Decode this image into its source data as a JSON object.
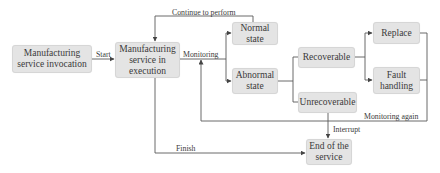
{
  "diagram": {
    "type": "flowchart",
    "nodes": {
      "invocation": "Manufacturing service invocation",
      "execution": "Manufacturing service in execution",
      "normal": "Normal state",
      "abnormal": "Abnormal state",
      "recoverable": "Recoverable",
      "unrecoverable": "Unrecoverable",
      "replace": "Replace",
      "fault_handling": "Fault handling",
      "end": "End of the service"
    },
    "edge_labels": {
      "start": "Start",
      "continue": "Continue to perform",
      "monitoring": "Monitoring",
      "monitoring_again": "Monitoring again",
      "interrupt": "Interrupt",
      "finish": "Finish"
    },
    "edges": [
      {
        "from": "invocation",
        "to": "execution",
        "label": "Start"
      },
      {
        "from": "execution",
        "to": "normal",
        "label": "Monitoring"
      },
      {
        "from": "execution",
        "to": "abnormal",
        "label": "Monitoring"
      },
      {
        "from": "normal",
        "to": "execution",
        "label": "Continue to perform"
      },
      {
        "from": "abnormal",
        "to": "recoverable",
        "label": ""
      },
      {
        "from": "abnormal",
        "to": "unrecoverable",
        "label": ""
      },
      {
        "from": "recoverable",
        "to": "replace",
        "label": ""
      },
      {
        "from": "recoverable",
        "to": "fault_handling",
        "label": ""
      },
      {
        "from": "replace",
        "to": "execution",
        "label": "Monitoring again"
      },
      {
        "from": "fault_handling",
        "to": "execution",
        "label": "Monitoring again"
      },
      {
        "from": "unrecoverable",
        "to": "end",
        "label": "Interrupt"
      },
      {
        "from": "execution",
        "to": "end",
        "label": "Finish"
      }
    ],
    "colors": {
      "node_fill": "#e4e4e4",
      "line": "#555555",
      "text": "#3a3a3a"
    }
  }
}
